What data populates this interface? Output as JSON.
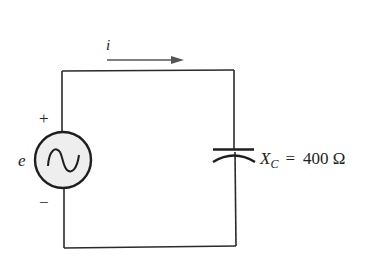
{
  "diagram": {
    "type": "ac-circuit",
    "current_label": "i",
    "source": {
      "label": "e",
      "positive_terminal": "+",
      "negative_terminal": "−",
      "symbol": "ac-sine-source"
    },
    "capacitor": {
      "reactance_symbol": "X",
      "reactance_subscript": "C",
      "equals": "=",
      "value": "400 Ω"
    }
  },
  "colors": {
    "wire": "#2a2a2a",
    "arrow": "#555555",
    "source_fill": "#eeeeee",
    "text": "#222222"
  }
}
